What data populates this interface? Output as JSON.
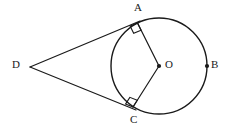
{
  "figure": {
    "type": "geometry-diagram",
    "background_color": "#ffffff",
    "stroke_color": "#1a1a1a",
    "label_color": "#1a1a1a"
  },
  "circle": {
    "label": "circle-O",
    "center_x": 159,
    "center_y": 66,
    "radius": 48,
    "stroke_width": 1.4
  },
  "points": {
    "A": {
      "label": "A",
      "x": 137.5,
      "y": 23.0,
      "label_x": 134,
      "label_y": 2,
      "has_dot": false
    },
    "B": {
      "label": "B",
      "x": 207,
      "y": 66,
      "label_x": 211,
      "label_y": 59,
      "has_dot": true
    },
    "C": {
      "label": "C",
      "x": 133.0,
      "y": 107.0,
      "label_x": 130,
      "label_y": 114,
      "has_dot": false
    },
    "D": {
      "label": "D",
      "x": 30,
      "y": 67,
      "label_x": 12,
      "label_y": 59,
      "has_dot": false
    },
    "O": {
      "label": "O",
      "x": 159,
      "y": 66,
      "label_x": 165,
      "label_y": 59,
      "has_dot": true
    }
  },
  "segments": [
    {
      "name": "tangent-DA",
      "from": "D",
      "to": "A",
      "x1": 30,
      "y1": 67,
      "x2": 140,
      "y2": 21
    },
    {
      "name": "tangent-DC",
      "from": "D",
      "to": "C",
      "x1": 30,
      "y1": 67,
      "x2": 136,
      "y2": 110
    },
    {
      "name": "radius-OA",
      "from": "O",
      "to": "A",
      "x1": 159,
      "y1": 66,
      "x2": 137.5,
      "y2": 23.0
    },
    {
      "name": "radius-OC",
      "from": "O",
      "to": "C",
      "x1": 159,
      "y1": 66,
      "x2": 133.0,
      "y2": 107.0
    }
  ],
  "right_angles": [
    {
      "name": "right-angle-at-A",
      "at": "A",
      "size": 8
    },
    {
      "name": "right-angle-at-C",
      "at": "C",
      "size": 8
    }
  ],
  "dot_radius": 2.1
}
